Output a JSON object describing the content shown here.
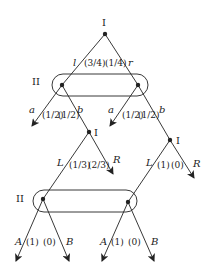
{
  "diagram": {
    "type": "extensive-form game tree",
    "players": {
      "p1": "I",
      "p2": "II"
    },
    "root": {
      "player": "I",
      "actions": [
        "l",
        "r"
      ],
      "probs": [
        "(3/4)",
        "(1/4)"
      ]
    },
    "info_set_top": {
      "player": "II",
      "actions": [
        "a",
        "b"
      ],
      "left_probs": [
        "(1/2)",
        "(1/2)"
      ],
      "right_probs": [
        "(1/2)",
        "(1/2)"
      ]
    },
    "mid_left": {
      "player": "I",
      "actions": [
        "L",
        "R"
      ],
      "probs": [
        "(1/3)",
        "(2/3)"
      ]
    },
    "mid_right": {
      "player": "I",
      "actions": [
        "L",
        "R"
      ],
      "probs": [
        "(1)",
        "(0)"
      ]
    },
    "info_set_bottom": {
      "player": "II",
      "actions": [
        "A",
        "B"
      ],
      "left_probs": [
        "(1)",
        "(0)"
      ],
      "right_probs": [
        "(1)",
        "(0)"
      ]
    }
  },
  "labels": {
    "root_player": "I",
    "top_ii": "II",
    "bottom_ii": "II",
    "mid_left_player": "I",
    "mid_right_player": "I",
    "l": "l",
    "r": "r",
    "a": "a",
    "b": "b",
    "L": "L",
    "R": "R",
    "A": "A",
    "B": "B",
    "p_root_l": "(3/4)",
    "p_root_r": "(1/4)",
    "p_a": "(1/2)",
    "p_b": "(1/2)",
    "p_ml_L": "(1/3)",
    "p_ml_R": "(2/3)",
    "p_mr_L": "(1)",
    "p_mr_R": "(0)",
    "p_A": "(1)",
    "p_B": "(0)"
  }
}
